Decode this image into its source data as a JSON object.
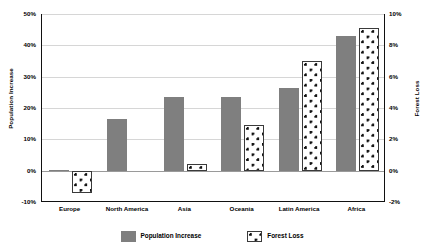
{
  "chart_data": {
    "type": "bar",
    "title": "",
    "xlabel": "",
    "categories": [
      "Europe",
      "North America",
      "Asia",
      "Oceania",
      "Latin America",
      "Africa"
    ],
    "series": [
      {
        "name": "Population Increase",
        "axis": "left",
        "unit": "%",
        "color": "#7f7f7f",
        "values": [
          0.2,
          16.5,
          23.5,
          23.5,
          26.5,
          43.0
        ]
      },
      {
        "name": "Forest Loss",
        "axis": "right",
        "unit": "%",
        "color": "#ffffff",
        "values": [
          -1.4,
          0.0,
          0.4,
          2.9,
          7.0,
          9.1
        ]
      }
    ],
    "left_axis": {
      "label": "Population Increase",
      "ticks": [
        "50%",
        "40%",
        "30%",
        "20%",
        "10%",
        "0%",
        "-10%"
      ],
      "tick_values": [
        50,
        40,
        30,
        20,
        10,
        0,
        -10
      ],
      "ylim": [
        -10,
        50
      ]
    },
    "right_axis": {
      "label": "Forest Loss",
      "ticks": [
        "10%",
        "8%",
        "6%",
        "4%",
        "2%",
        "0%",
        "-2%"
      ],
      "tick_values": [
        10,
        8,
        6,
        4,
        2,
        0,
        -2
      ],
      "ylim": [
        -2,
        10
      ]
    },
    "legend": {
      "position": "bottom",
      "entries": [
        {
          "label": "Population Increase",
          "pattern": "solid-gray"
        },
        {
          "label": "Forest Loss",
          "pattern": "dotted-white"
        }
      ]
    },
    "grid": true
  }
}
